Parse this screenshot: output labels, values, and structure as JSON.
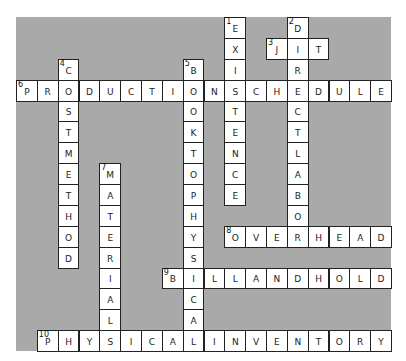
{
  "puzzle": {
    "rows": 16,
    "cols": 18,
    "colors": {
      "board": "#a9a9a9",
      "cell": "#ffffff",
      "border": "#222222"
    },
    "words": [
      {
        "number": 1,
        "direction": "down",
        "answer": "EXISTENCE",
        "row": 0,
        "col": 10
      },
      {
        "number": 2,
        "direction": "down",
        "answer": "DIRECTLABOR",
        "row": 0,
        "col": 13
      },
      {
        "number": 3,
        "direction": "across",
        "answer": "JIT",
        "row": 1,
        "col": 12
      },
      {
        "number": 4,
        "direction": "down",
        "answer": "COSTMETHOD",
        "row": 2,
        "col": 2
      },
      {
        "number": 5,
        "direction": "down",
        "answer": "BOOKTOPHYSICAL",
        "row": 2,
        "col": 8
      },
      {
        "number": 6,
        "direction": "across",
        "answer": "PRODUCTIONSCHEDULE",
        "row": 3,
        "col": 0
      },
      {
        "number": 7,
        "direction": "down",
        "answer": "MATERIAL",
        "row": 7,
        "col": 4
      },
      {
        "number": 8,
        "direction": "across",
        "answer": "OVERHEAD",
        "row": 10,
        "col": 10
      },
      {
        "number": 9,
        "direction": "across",
        "answer": "BILLANDHOLD",
        "row": 12,
        "col": 7
      },
      {
        "number": 10,
        "direction": "across",
        "answer": "PHYSICALINVENTORY",
        "row": 15,
        "col": 1
      }
    ]
  }
}
